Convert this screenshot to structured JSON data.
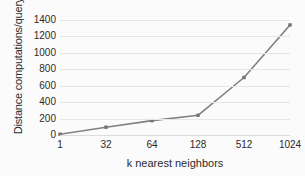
{
  "chart_data": {
    "type": "line",
    "title": "",
    "subtitle": "",
    "xlabel": "k nearest neighbors",
    "ylabel": "Distance computations/query",
    "categories": [
      "1",
      "32",
      "64",
      "128",
      "512",
      "1024"
    ],
    "values": [
      10,
      95,
      175,
      240,
      700,
      1340
    ],
    "series": [
      {
        "name": "Distance computations/query",
        "values": [
          10,
          95,
          175,
          240,
          700,
          1340
        ]
      }
    ],
    "yticks": [
      "0",
      "200",
      "400",
      "600",
      "800",
      "1000",
      "1200",
      "1400"
    ],
    "ytick_values": [
      0,
      200,
      400,
      600,
      800,
      1000,
      1200,
      1400
    ],
    "ylim": [
      0,
      1400
    ],
    "xlim": [
      0,
      5
    ],
    "grid": "horizontal",
    "legend": "none",
    "marker": "square",
    "line_color": "#808080",
    "marker_color": "#737373",
    "grid_color": "#e6e6e6",
    "background_color": "#fbfbfb",
    "text_color": "#2b2b2b"
  }
}
